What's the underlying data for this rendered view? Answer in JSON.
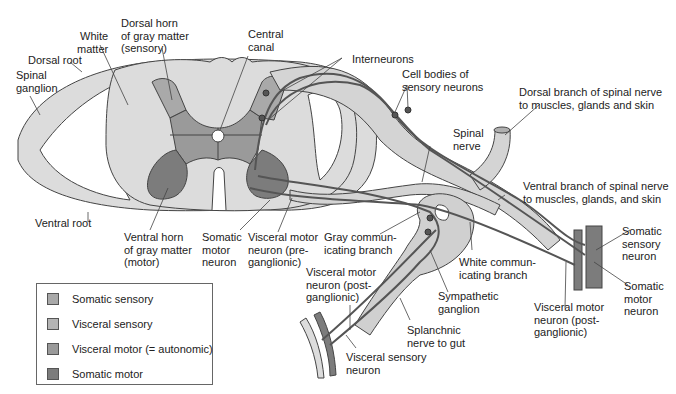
{
  "colors": {
    "white_matter": "#dcdcdc",
    "somatic_sensory": "#a9a9a9",
    "visceral_sensory": "#b4b4b4",
    "visceral_motor": "#9a9a9a",
    "somatic_motor": "#7c7c7c",
    "outline": "#444444"
  },
  "labels": {
    "white_matter": "White\nmatter",
    "dorsal_horn": "Dorsal horn\nof gray matter\n(sensory)",
    "central_canal": "Central\ncanal",
    "interneurons": "Interneurons",
    "dorsal_root": "Dorsal root",
    "spinal_ganglion": "Spinal\nganglion",
    "cell_bodies_sensory": "Cell bodies of\nsensory neurons",
    "dorsal_branch": "Dorsal branch of spinal nerve\nto muscles, glands and skin",
    "spinal_nerve": "Spinal\nnerve",
    "ventral_branch": "Ventral branch of spinal nerve\nto muscles, glands, and skin",
    "ventral_root": "Ventral root",
    "ventral_horn": "Ventral horn\nof gray matter\n(motor)",
    "somatic_motor_neuron_left": "Somatic\nmotor\nneuron",
    "visceral_motor_pre": "Visceral motor\nneuron (pre-\nganglionic)",
    "gray_comm_branch": "Gray commun-\nicating branch",
    "white_comm_branch": "White commun-\nicating branch",
    "somatic_sensory_neuron_right": "Somatic\nsensory\nneuron",
    "somatic_motor_neuron_right": "Somatic\nmotor\nneuron",
    "visceral_motor_post_left": "Visceral motor\nneuron (post-\nganglionic)",
    "sympathetic_ganglion": "Sympathetic\nganglion",
    "visceral_motor_post_right": "Visceral motor\nneuron (post-\nganglionic)",
    "splanchnic_nerve": "Splanchnic\nnerve to gut",
    "visceral_sensory_neuron": "Visceral sensory\nneuron"
  },
  "legend": {
    "items": [
      {
        "label": "Somatic sensory",
        "color": "#a9a9a9"
      },
      {
        "label": "Visceral sensory",
        "color": "#b4b4b4"
      },
      {
        "label": "Visceral motor (= autonomic)",
        "color": "#9a9a9a"
      },
      {
        "label": "Somatic motor",
        "color": "#7c7c7c"
      }
    ]
  }
}
